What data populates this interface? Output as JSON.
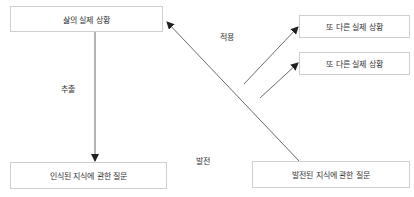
{
  "diagram": {
    "nodes": {
      "real_situation": "삶의 실제 상황",
      "recognized_question": "인식된 지식에 관한 질문",
      "other_situation_1": "또 다른 실제 상황",
      "other_situation_2": "또 다른 실제 상황",
      "developed_question": "발전된 지식에 관한 질문"
    },
    "edge_labels": {
      "extract": "추출",
      "apply": "적용",
      "develop": "발전"
    },
    "colors": {
      "line": "#444444",
      "box_border": "#cfcfcf",
      "text": "#333333"
    }
  }
}
